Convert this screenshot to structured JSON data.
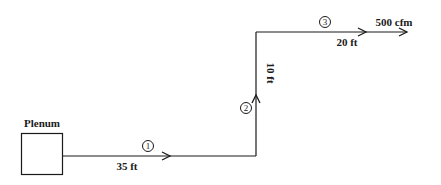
{
  "diagram": {
    "plenum": {
      "label": "Plenum"
    },
    "sections": [
      {
        "number": "1",
        "length": "35 ft"
      },
      {
        "number": "2",
        "length": "10 ft"
      },
      {
        "number": "3",
        "length": "20 ft"
      }
    ],
    "outlet": {
      "flow": "500 cfm"
    },
    "colors": {
      "line": "#1a1a1a",
      "background": "#ffffff"
    }
  }
}
